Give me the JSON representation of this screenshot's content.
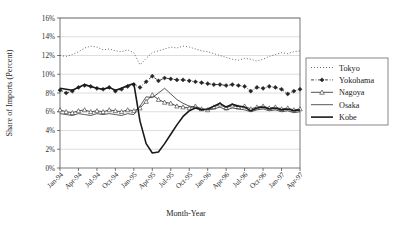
{
  "chart_data": {
    "type": "line",
    "title": "",
    "xlabel": "Month-Year",
    "ylabel": "Share of Imports (Percent)",
    "ylim": [
      0,
      16
    ],
    "ytick_values": [
      0,
      2,
      4,
      6,
      8,
      10,
      12,
      14,
      16
    ],
    "ytick_labels": [
      "0%",
      "2%",
      "4%",
      "6%",
      "8%",
      "10%",
      "12%",
      "14%",
      "16%"
    ],
    "grid": true,
    "legend_position": "right",
    "x": [
      "Jan-94",
      "Feb-94",
      "Mar-94",
      "Apr-94",
      "May-94",
      "Jun-94",
      "Jul-94",
      "Aug-94",
      "Sep-94",
      "Oct-94",
      "Nov-94",
      "Dec-94",
      "Jan-95",
      "Feb-95",
      "Mar-95",
      "Apr-95",
      "May-95",
      "Jun-95",
      "Jul-95",
      "Aug-95",
      "Sep-95",
      "Oct-95",
      "Nov-95",
      "Dec-95",
      "Jan-96",
      "Feb-96",
      "Mar-96",
      "Apr-96",
      "May-96",
      "Jun-96",
      "Jul-96",
      "Aug-96",
      "Sep-96",
      "Oct-96",
      "Nov-96",
      "Dec-96",
      "Jan-97",
      "Feb-97",
      "Mar-97",
      "Apr-97"
    ],
    "xtick_labels": [
      "Jan-94",
      "Apr-94",
      "Jul-94",
      "Oct-94",
      "Jan-95",
      "Apr-95",
      "Jul-95",
      "Oct-95",
      "Jan-96",
      "Apr-96",
      "Jul-96",
      "Oct-96",
      "Jan-97",
      "Apr-97"
    ],
    "xtick_indices": [
      0,
      3,
      6,
      9,
      12,
      15,
      18,
      21,
      24,
      27,
      30,
      33,
      36,
      39
    ],
    "series": [
      {
        "name": "Tokyo",
        "style": "dotted",
        "marker": "none",
        "color": "#4d4d4d",
        "values": [
          12.0,
          11.9,
          12.1,
          12.4,
          12.8,
          13.0,
          12.9,
          12.6,
          12.7,
          12.5,
          12.4,
          12.6,
          12.3,
          11.0,
          11.7,
          12.3,
          12.5,
          12.7,
          12.9,
          12.8,
          13.0,
          12.9,
          12.7,
          12.5,
          12.4,
          12.2,
          12.0,
          11.8,
          11.6,
          11.5,
          11.7,
          11.6,
          11.4,
          11.6,
          11.9,
          12.1,
          12.3,
          12.2,
          12.4,
          12.5
        ]
      },
      {
        "name": "Yokohama",
        "style": "dash-dot",
        "marker": "diamond",
        "color": "#262626",
        "values": [
          8.3,
          8.0,
          8.2,
          8.6,
          8.8,
          8.7,
          8.5,
          8.4,
          8.6,
          8.2,
          8.4,
          8.7,
          8.9,
          8.6,
          9.2,
          9.8,
          9.3,
          9.6,
          9.5,
          9.4,
          9.4,
          9.3,
          9.2,
          9.1,
          9.0,
          8.9,
          8.9,
          8.8,
          8.9,
          8.8,
          8.7,
          8.2,
          8.6,
          8.5,
          8.7,
          8.6,
          8.4,
          7.9,
          8.2,
          8.4
        ]
      },
      {
        "name": "Nagoya",
        "style": "solid-thin",
        "marker": "triangle",
        "color": "#333333",
        "values": [
          6.2,
          6.0,
          5.9,
          6.1,
          6.2,
          6.0,
          6.1,
          6.0,
          6.2,
          6.1,
          6.0,
          6.2,
          6.1,
          6.4,
          7.1,
          7.8,
          7.3,
          7.0,
          6.9,
          6.6,
          6.5,
          6.4,
          6.6,
          6.3,
          6.2,
          6.5,
          6.8,
          6.4,
          6.7,
          6.5,
          6.6,
          6.3,
          6.5,
          6.6,
          6.4,
          6.5,
          6.3,
          6.4,
          6.2,
          6.3
        ]
      },
      {
        "name": "Osaka",
        "style": "solid-thin",
        "marker": "none",
        "color": "#3a3a3a",
        "values": [
          5.8,
          5.7,
          5.6,
          5.8,
          5.7,
          5.6,
          5.8,
          5.7,
          5.8,
          5.7,
          5.6,
          5.8,
          5.7,
          6.6,
          7.6,
          7.5,
          8.0,
          8.5,
          7.9,
          7.3,
          6.9,
          6.6,
          6.5,
          6.3,
          6.2,
          6.3,
          6.5,
          6.2,
          6.4,
          6.3,
          6.2,
          6.0,
          6.2,
          6.3,
          6.1,
          6.2,
          6.0,
          6.1,
          5.9,
          6.0
        ]
      },
      {
        "name": "Kobe",
        "style": "solid-thick",
        "marker": "none",
        "color": "#1a1a1a",
        "values": [
          8.5,
          8.4,
          8.3,
          8.6,
          8.9,
          8.7,
          8.5,
          8.4,
          8.6,
          8.3,
          8.5,
          8.8,
          9.0,
          5.0,
          2.6,
          1.6,
          1.7,
          2.6,
          3.6,
          4.6,
          5.5,
          6.1,
          6.4,
          6.2,
          6.3,
          6.6,
          6.9,
          6.5,
          6.8,
          6.6,
          6.5,
          6.1,
          6.4,
          6.5,
          6.3,
          6.4,
          6.2,
          6.3,
          6.1,
          6.2
        ]
      }
    ]
  },
  "legend": {
    "items": [
      {
        "label": "Tokyo"
      },
      {
        "label": "Yokohama"
      },
      {
        "label": "Nagoya"
      },
      {
        "label": "Osaka"
      },
      {
        "label": "Kobe"
      }
    ]
  }
}
